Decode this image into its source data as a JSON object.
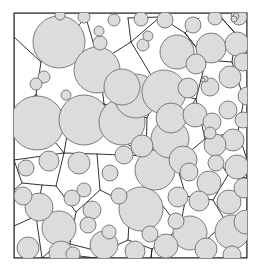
{
  "figure": {
    "kind": "laguerre-voronoi-disk-packing",
    "title": "",
    "caption": "",
    "width": 264,
    "height": 272
  },
  "colors": {
    "background": "#ffffff",
    "disk_fill": "#dcdcdc",
    "disk_stroke": "#6f6f6f",
    "cell_edge": "#1b1b1b",
    "frame_border": "#2b2b2b"
  },
  "frame": {
    "x": 14,
    "y": 13,
    "width": 233,
    "height": 245
  },
  "chart_data": {
    "type": "scatter",
    "title": "",
    "xlabel": "",
    "ylabel": "",
    "xlim": [
      14,
      247
    ],
    "ylim": [
      13,
      258
    ],
    "grid": false,
    "legend": "none",
    "annotations": [],
    "series": [
      {
        "name": "disks",
        "encoding": "cx,cy,r",
        "count": 84,
        "values": [
          [
            59,
            42,
            26
          ],
          [
            97,
            70,
            23
          ],
          [
            136,
            96,
            22
          ],
          [
            37,
            123,
            27
          ],
          [
            84,
            120,
            25
          ],
          [
            122,
            122,
            23
          ],
          [
            164,
            92,
            22
          ],
          [
            177,
            52,
            17
          ],
          [
            211,
            48,
            15
          ],
          [
            141,
            209,
            22
          ],
          [
            100,
            43,
            7
          ],
          [
            99,
            31,
            5
          ],
          [
            143,
            45,
            6
          ],
          [
            148,
            36,
            5
          ],
          [
            44,
            77,
            6
          ],
          [
            36,
            84,
            6
          ],
          [
            190,
            233,
            17
          ],
          [
            170,
            139,
            19
          ],
          [
            59,
            228,
            17
          ],
          [
            155,
            170,
            20
          ],
          [
            183,
            160,
            14
          ],
          [
            209,
            183,
            12
          ],
          [
            199,
            201,
            10
          ],
          [
            229,
            202,
            12
          ],
          [
            232,
            232,
            17
          ],
          [
            104,
            245,
            14
          ],
          [
            166,
            246,
            12
          ],
          [
            206,
            249,
            11
          ],
          [
            135,
            251,
            10
          ],
          [
            233,
            140,
            11
          ],
          [
            237,
            167,
            12
          ],
          [
            215,
            145,
            11
          ],
          [
            212,
            122,
            9
          ],
          [
            228,
            110,
            9
          ],
          [
            230,
            77,
            11
          ],
          [
            210,
            87,
            9
          ],
          [
            195,
            115,
            12
          ],
          [
            237,
            44,
            12
          ],
          [
            239,
            17,
            8
          ],
          [
            215,
            18,
            7
          ],
          [
            193,
            25,
            8
          ],
          [
            165,
            20,
            8
          ],
          [
            141,
            19,
            7
          ],
          [
            114,
            20,
            6
          ],
          [
            84,
            17,
            6
          ],
          [
            60,
            15,
            5
          ],
          [
            205,
            79,
            3
          ],
          [
            203,
            80,
            2
          ],
          [
            236,
            16,
            3
          ],
          [
            234,
            19,
            3
          ],
          [
            142,
            146,
            11
          ],
          [
            124,
            155,
            9
          ],
          [
            110,
            173,
            8
          ],
          [
            79,
            163,
            11
          ],
          [
            49,
            161,
            10
          ],
          [
            26,
            168,
            8
          ],
          [
            23,
            196,
            9
          ],
          [
            39,
            207,
            14
          ],
          [
            72,
            198,
            8
          ],
          [
            84,
            190,
            7
          ],
          [
            92,
            210,
            9
          ],
          [
            88,
            225,
            8
          ],
          [
            119,
            196,
            8
          ],
          [
            109,
            232,
            7
          ],
          [
            61,
            253,
            12
          ],
          [
            28,
            248,
            11
          ],
          [
            178,
            197,
            10
          ],
          [
            189,
            172,
            9
          ],
          [
            216,
            163,
            8
          ],
          [
            244,
            188,
            10
          ],
          [
            243,
            120,
            8
          ],
          [
            247,
            96,
            9
          ],
          [
            188,
            88,
            10
          ],
          [
            171,
            118,
            15
          ],
          [
            196,
            64,
            10
          ],
          [
            122,
            87,
            18
          ],
          [
            66,
            95,
            5
          ],
          [
            243,
            62,
            9
          ],
          [
            246,
            222,
            12
          ],
          [
            176,
            221,
            8
          ],
          [
            232,
            255,
            9
          ],
          [
            150,
            234,
            8
          ],
          [
            73,
            254,
            7
          ],
          [
            210,
            133,
            6
          ]
        ]
      }
    ],
    "cell_polylines": [
      "14,13 14,258 247,258 247,13 14,13",
      "14,37 41,62 36,95 14,108",
      "41,62 86,18",
      "36,95 70,118 64,153 14,160",
      "70,118 104,104 99,62 86,18",
      "99,62 131,42 128,18",
      "104,104 147,118 160,90 131,42",
      "147,118 146,156 97,154 64,153",
      "160,90 196,99 206,60 185,33 160,17",
      "196,99 205,139 176,163 146,156",
      "205,139 238,131 244,99 232,62 206,60",
      "232,62 236,34 217,13",
      "238,131 247,160",
      "176,163 186,196 213,200 228,175 205,139",
      "228,175 247,178",
      "186,196 180,228 205,241 226,222 213,200",
      "226,222 247,216",
      "180,228 152,249 151,258",
      "205,241 210,258",
      "97,154 100,190 130,205 152,192 146,156",
      "130,205 128,240 102,252 95,258",
      "152,192 180,228",
      "128,240 152,249",
      "64,153 56,186 76,212 100,190",
      "76,212 70,244 49,252 42,258",
      "49,252 95,258",
      "14,160 22,183 42,185 56,186",
      "42,185 36,216 14,226",
      "36,216 42,258",
      "14,108 42,126 64,153",
      "42,126 36,95",
      "128,18 160,17",
      "185,33 199,18",
      "217,13 236,34",
      "247,40 236,34",
      "244,99 247,104",
      "86,18 88,13",
      "131,42 160,17",
      "206,60 185,33",
      "22,183 14,190",
      "70,244 102,252",
      "151,258 152,249",
      "110,133 146,156",
      "110,133 104,104",
      "196,99 171,133 176,163",
      "171,133 146,156"
    ]
  }
}
